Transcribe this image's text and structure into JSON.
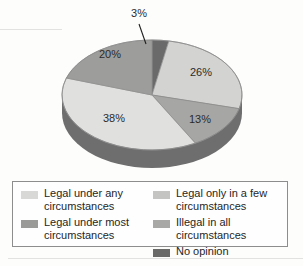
{
  "chart_data": {
    "type": "pie",
    "title": "",
    "subtitle": "",
    "xlabel": "",
    "ylabel": "",
    "grid": false,
    "legend_position": "bottom",
    "three_d": true,
    "start_angle_deg": 0,
    "direction": "clockwise",
    "categories": [
      "Legal under any circumstances",
      "Legal only in a few circumstances",
      "Legal under most circumstances",
      "Illegal in all circumstances",
      "No opinion"
    ],
    "values": [
      38,
      26,
      20,
      13,
      3
    ],
    "value_labels": [
      "38%",
      "26%",
      "20%",
      "13%",
      "3%"
    ],
    "slices": [
      {
        "label": "No opinion",
        "value": 3,
        "value_label": "3%",
        "color": "#6a6a6a",
        "side_color": "#4d4d4d",
        "start_deg": 0,
        "end_deg": 10.8,
        "label_x": 139,
        "label_y": 14,
        "leader_line": true
      },
      {
        "label": "Legal only in a few circumstances",
        "value": 26,
        "value_label": "26%",
        "color": "#d3d3d1",
        "side_color": "#9d9d9b",
        "start_deg": 10.8,
        "end_deg": 104.4,
        "label_x": 201,
        "label_y": 73
      },
      {
        "label": "Illegal in all circumstances",
        "value": 13,
        "value_label": "13%",
        "color": "#a6a6a4",
        "side_color": "#7c7c7a",
        "start_deg": 104.4,
        "end_deg": 151.2,
        "label_x": 200,
        "label_y": 120
      },
      {
        "label": "Legal under any circumstances",
        "value": 38,
        "value_label": "38%",
        "color": "#e0e0de",
        "side_color": "#6e6e6e",
        "start_deg": 151.2,
        "end_deg": 288.0,
        "label_x": 114,
        "label_y": 119
      },
      {
        "label": "Legal under most circumstances",
        "value": 20,
        "value_label": "20%",
        "color": "#9d9d9b",
        "side_color": "#767674",
        "start_deg": 288.0,
        "end_deg": 360.0,
        "label_x": 110,
        "label_y": 55
      }
    ]
  },
  "legend": {
    "columns": [
      {
        "items": [
          {
            "label": "Legal under any\ncircumstances",
            "color": "#d8d8d6",
            "swatch_name": "legend-swatch-legal-under-any"
          },
          {
            "label": "Legal under most\ncircumstances",
            "color": "#9a9a98",
            "swatch_name": "legend-swatch-legal-under-most"
          }
        ]
      },
      {
        "items": [
          {
            "label": "Legal only in a few\ncircumstances",
            "color": "#c4c4c2",
            "swatch_name": "legend-swatch-legal-only-few"
          },
          {
            "label": "Illegal in all circumstances",
            "color": "#a8a8a6",
            "swatch_name": "legend-swatch-illegal-all"
          },
          {
            "label": "No opinion",
            "color": "#6a6a68",
            "swatch_name": "legend-swatch-no-opinion"
          }
        ]
      }
    ]
  },
  "colors": {
    "background": "#fdfdfc",
    "legend_border": "#8d8d8d",
    "label_text": "#2b2b2b",
    "leader_line": "#1f1f1f"
  }
}
